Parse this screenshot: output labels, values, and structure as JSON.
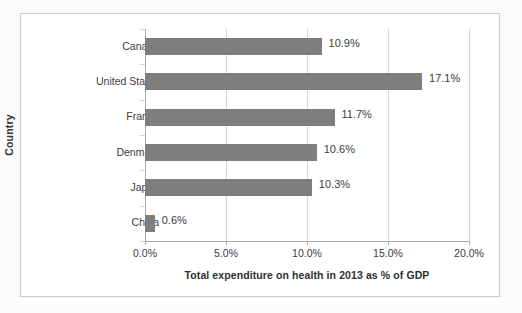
{
  "chart_data": {
    "type": "bar",
    "orientation": "horizontal",
    "title": "",
    "xlabel": "Total expenditure on health in 2013 as % of GDP",
    "ylabel": "Country",
    "categories": [
      "Canada",
      "United States",
      "France",
      "Denmark",
      "Japan",
      "China"
    ],
    "values": [
      10.9,
      17.1,
      11.7,
      10.6,
      10.3,
      0.6
    ],
    "data_labels": [
      "10.9%",
      "17.1%",
      "11.7%",
      "10.6%",
      "10.3%",
      "0.6%"
    ],
    "xlim": [
      0,
      20
    ],
    "xticks": [
      0,
      5,
      10,
      15,
      20
    ],
    "xtick_labels": [
      "0.0%",
      "5.0%",
      "10.0%",
      "15.0%",
      "20.0%"
    ],
    "grid": "vertical",
    "legend": "none",
    "bar_color": "#7e7e7e",
    "gridline_color": "#d5d5d5",
    "axis_color": "#a8a8a8",
    "text_color": "#3c3c3c",
    "frame_color": "#c9c9c9",
    "background_color": "#ffffff"
  }
}
